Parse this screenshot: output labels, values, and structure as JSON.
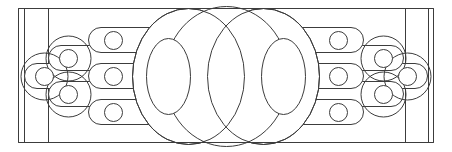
{
  "figure": {
    "canvas": {
      "width": 452,
      "height": 152,
      "background": "#ffffff"
    },
    "stroke_color": "#3c3c3c",
    "stroke_color_light": "#6e6e6e",
    "stroke_width": 1,
    "frame": {
      "name": "outer-rectangle",
      "x": 18,
      "y": 8,
      "width": 416,
      "height": 135,
      "inner_vertical_lines_x": [
        24,
        48,
        405,
        428
      ]
    },
    "center_ellipses": [
      {
        "name": "left-large-ellipse",
        "cx": 188,
        "cy": 76,
        "rx": 56,
        "ry": 68
      },
      {
        "name": "center-large-ellipse",
        "cx": 226,
        "cy": 76,
        "rx": 62,
        "ry": 70
      },
      {
        "name": "right-large-ellipse",
        "cx": 264,
        "cy": 76,
        "rx": 56,
        "ry": 68
      }
    ],
    "inner_ellipses": [
      {
        "name": "inner-left-ellipse",
        "cx": 168,
        "cy": 76,
        "rx": 22,
        "ry": 38
      },
      {
        "name": "inner-right-ellipse",
        "cx": 284,
        "cy": 76,
        "rx": 22,
        "ry": 38
      }
    ],
    "pill_tiers_left": [
      {
        "name": "pill-left-tier1-top",
        "x": 88,
        "y": 27,
        "width": 108,
        "height": 26,
        "circle_cx": 113,
        "circle_cy": 40,
        "circle_r": 9
      },
      {
        "name": "pill-left-tier1-middle",
        "x": 88,
        "y": 63,
        "width": 108,
        "height": 26,
        "circle_cx": 113,
        "circle_cy": 76,
        "circle_r": 9
      },
      {
        "name": "pill-left-tier1-bottom",
        "x": 88,
        "y": 99,
        "width": 108,
        "height": 26,
        "circle_cx": 113,
        "circle_cy": 112,
        "circle_r": 9
      },
      {
        "name": "pill-left-tier2-upper",
        "x": 48,
        "y": 45,
        "width": 116,
        "height": 26,
        "circle_cx": 68,
        "circle_cy": 58,
        "circle_r": 9
      },
      {
        "name": "pill-left-tier2-lower",
        "x": 48,
        "y": 81,
        "width": 116,
        "height": 26,
        "circle_cx": 68,
        "circle_cy": 94,
        "circle_r": 9
      },
      {
        "name": "pill-left-tier3-center",
        "x": 24,
        "y": 63,
        "width": 120,
        "height": 26,
        "circle_cx": 44,
        "circle_cy": 76,
        "circle_r": 9
      }
    ],
    "pill_tiers_right": [
      {
        "name": "pill-right-tier1-top",
        "x": 256,
        "y": 27,
        "width": 108,
        "height": 26,
        "circle_cx": 339,
        "circle_cy": 40,
        "circle_r": 9
      },
      {
        "name": "pill-right-tier1-middle",
        "x": 256,
        "y": 63,
        "width": 108,
        "height": 26,
        "circle_cx": 339,
        "circle_cy": 76,
        "circle_r": 9
      },
      {
        "name": "pill-right-tier1-bottom",
        "x": 256,
        "y": 99,
        "width": 108,
        "height": 26,
        "circle_cx": 339,
        "circle_cy": 112,
        "circle_r": 9
      },
      {
        "name": "pill-right-tier2-upper",
        "x": 288,
        "y": 45,
        "width": 116,
        "height": 26,
        "circle_cx": 384,
        "circle_cy": 58,
        "circle_r": 9
      },
      {
        "name": "pill-right-tier2-lower",
        "x": 288,
        "y": 81,
        "width": 116,
        "height": 26,
        "circle_cx": 384,
        "circle_cy": 94,
        "circle_r": 9
      },
      {
        "name": "pill-right-tier3-center",
        "x": 308,
        "y": 63,
        "width": 120,
        "height": 26,
        "circle_cx": 408,
        "circle_cy": 76,
        "circle_r": 9
      }
    ],
    "ellipse_outlines_left": [
      {
        "name": "outline-left-tier3",
        "cx": 44,
        "cy": 76,
        "rx": 24,
        "ry": 24
      },
      {
        "name": "outline-left-tier2-upper",
        "cx": 68,
        "cy": 58,
        "rx": 23,
        "ry": 23
      },
      {
        "name": "outline-left-tier2-lower",
        "cx": 68,
        "cy": 94,
        "rx": 23,
        "ry": 23
      }
    ],
    "ellipse_outlines_right": [
      {
        "name": "outline-right-tier3",
        "cx": 408,
        "cy": 76,
        "rx": 24,
        "ry": 24
      },
      {
        "name": "outline-right-tier2-upper",
        "cx": 384,
        "cy": 58,
        "rx": 23,
        "ry": 23
      },
      {
        "name": "outline-right-tier2-lower",
        "cx": 384,
        "cy": 94,
        "rx": 23,
        "ry": 23
      }
    ]
  }
}
